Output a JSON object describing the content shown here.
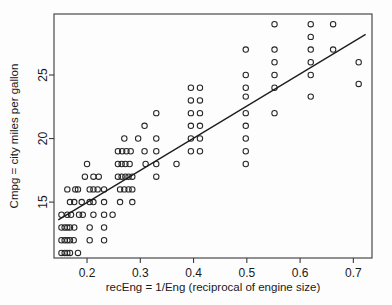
{
  "chart_data": {
    "type": "scatter",
    "title": "",
    "xlabel": "recEng = 1/Eng (reciprocal of engine size)",
    "ylabel": "Cmpg = city miles per gallon",
    "xlim": [
      0.138,
      0.735
    ],
    "ylim": [
      10.6,
      29.8
    ],
    "xticks": [
      0.2,
      0.3,
      0.4,
      0.5,
      0.6,
      0.7
    ],
    "xticklabels": [
      "0.2",
      "0.3",
      "0.4",
      "0.5",
      "0.6",
      "0.7"
    ],
    "yticks": [
      15,
      20,
      25
    ],
    "yticklabels": [
      "15",
      "20",
      "25"
    ],
    "grid": false,
    "legend": null,
    "marker": "open-circle",
    "marker_color": "#262626",
    "line_color": "#1c1c1c",
    "series": [
      {
        "name": "vehicles",
        "points": [
          [
            0.152,
            11.0
          ],
          [
            0.158,
            11.0
          ],
          [
            0.163,
            11.0
          ],
          [
            0.168,
            11.0
          ],
          [
            0.183,
            11.0
          ],
          [
            0.152,
            12.0
          ],
          [
            0.158,
            12.0
          ],
          [
            0.163,
            12.0
          ],
          [
            0.168,
            12.0
          ],
          [
            0.175,
            12.0
          ],
          [
            0.205,
            12.0
          ],
          [
            0.232,
            12.0
          ],
          [
            0.152,
            13.0
          ],
          [
            0.158,
            13.0
          ],
          [
            0.163,
            13.0
          ],
          [
            0.168,
            13.0
          ],
          [
            0.176,
            13.0
          ],
          [
            0.205,
            13.0
          ],
          [
            0.232,
            13.0
          ],
          [
            0.152,
            14.0
          ],
          [
            0.163,
            14.0
          ],
          [
            0.17,
            14.0
          ],
          [
            0.185,
            14.0
          ],
          [
            0.192,
            14.0
          ],
          [
            0.212,
            14.0
          ],
          [
            0.232,
            14.0
          ],
          [
            0.248,
            14.0
          ],
          [
            0.168,
            15.0
          ],
          [
            0.176,
            15.0
          ],
          [
            0.19,
            15.0
          ],
          [
            0.205,
            15.0
          ],
          [
            0.212,
            15.0
          ],
          [
            0.232,
            15.0
          ],
          [
            0.262,
            15.0
          ],
          [
            0.285,
            15.0
          ],
          [
            0.163,
            16.0
          ],
          [
            0.178,
            16.0
          ],
          [
            0.183,
            16.0
          ],
          [
            0.205,
            16.0
          ],
          [
            0.212,
            16.0
          ],
          [
            0.22,
            16.0
          ],
          [
            0.232,
            16.0
          ],
          [
            0.262,
            16.0
          ],
          [
            0.27,
            16.0
          ],
          [
            0.278,
            16.0
          ],
          [
            0.285,
            16.0
          ],
          [
            0.196,
            17.0
          ],
          [
            0.212,
            17.0
          ],
          [
            0.222,
            17.0
          ],
          [
            0.258,
            17.0
          ],
          [
            0.265,
            17.0
          ],
          [
            0.272,
            17.0
          ],
          [
            0.278,
            17.0
          ],
          [
            0.285,
            17.0
          ],
          [
            0.33,
            17.0
          ],
          [
            0.2,
            18.0
          ],
          [
            0.258,
            18.0
          ],
          [
            0.265,
            18.0
          ],
          [
            0.272,
            18.0
          ],
          [
            0.28,
            18.0
          ],
          [
            0.31,
            18.0
          ],
          [
            0.33,
            18.0
          ],
          [
            0.368,
            18.0
          ],
          [
            0.498,
            18.0
          ],
          [
            0.258,
            19.0
          ],
          [
            0.266,
            19.0
          ],
          [
            0.274,
            19.0
          ],
          [
            0.282,
            19.0
          ],
          [
            0.308,
            19.0
          ],
          [
            0.33,
            19.0
          ],
          [
            0.395,
            19.0
          ],
          [
            0.412,
            19.0
          ],
          [
            0.498,
            19.0
          ],
          [
            0.27,
            20.0
          ],
          [
            0.296,
            20.0
          ],
          [
            0.33,
            20.0
          ],
          [
            0.395,
            20.0
          ],
          [
            0.412,
            20.0
          ],
          [
            0.498,
            20.0
          ],
          [
            0.308,
            21.0
          ],
          [
            0.395,
            21.0
          ],
          [
            0.412,
            21.0
          ],
          [
            0.498,
            21.0
          ],
          [
            0.33,
            22.0
          ],
          [
            0.395,
            22.0
          ],
          [
            0.412,
            22.0
          ],
          [
            0.498,
            22.0
          ],
          [
            0.552,
            22.0
          ],
          [
            0.395,
            23.0
          ],
          [
            0.412,
            23.0
          ],
          [
            0.498,
            23.3
          ],
          [
            0.62,
            23.3
          ],
          [
            0.71,
            24.3
          ],
          [
            0.395,
            24.0
          ],
          [
            0.412,
            24.0
          ],
          [
            0.498,
            24.0
          ],
          [
            0.552,
            24.0
          ],
          [
            0.498,
            25.0
          ],
          [
            0.552,
            25.0
          ],
          [
            0.62,
            25.0
          ],
          [
            0.552,
            26.0
          ],
          [
            0.62,
            26.0
          ],
          [
            0.71,
            26.0
          ],
          [
            0.498,
            27.0
          ],
          [
            0.552,
            27.0
          ],
          [
            0.62,
            27.0
          ],
          [
            0.662,
            27.0
          ],
          [
            0.62,
            28.0
          ],
          [
            0.552,
            29.0
          ],
          [
            0.62,
            29.0
          ],
          [
            0.662,
            29.0
          ]
        ]
      }
    ],
    "regression_line": {
      "x_start": 0.146,
      "y_start": 13.6,
      "x_end": 0.723,
      "y_end": 28.2
    }
  }
}
